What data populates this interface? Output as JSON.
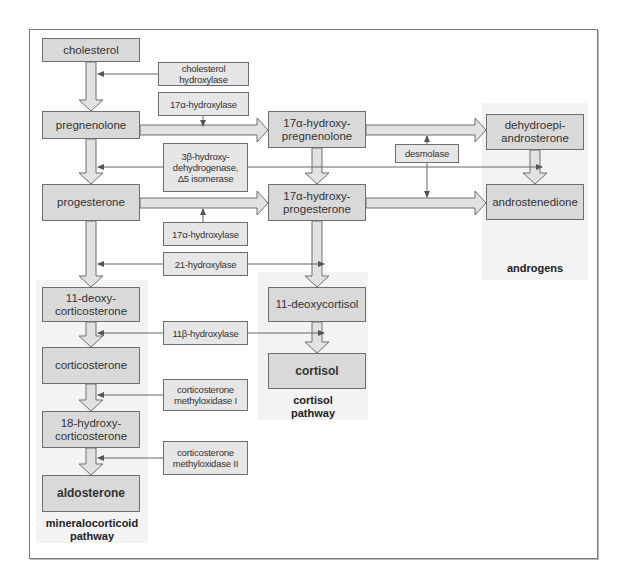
{
  "diagram": {
    "colors": {
      "box_fill": "#d9d9d9",
      "enzyme_fill": "#e6e6e6",
      "zone_fill": "#f3f3f3",
      "stroke": "#6e6e6e",
      "arrow_fill": "#e2e2e2"
    },
    "nodes": {
      "cholesterol": "cholesterol",
      "pregnenolone": "pregnenolone",
      "progesterone": "progesterone",
      "deoxycorticosterone": "11-deoxy-\ncorticosterone",
      "corticosterone": "corticosterone",
      "hydroxycorticosterone": "18-hydroxy-\ncorticosterone",
      "aldosterone": "aldosterone",
      "hydroxypregnenolone": "17α-hydroxy-\npregnenolone",
      "hydroxyprogesterone": "17α-hydroxy-\nprogesterone",
      "deoxycortisol": "11-deoxycortisol",
      "cortisol": "cortisol",
      "dhea": "dehydroepi-\nandrosterone",
      "androstenedione": "androstenedione"
    },
    "enzymes": {
      "cholesterol_hydroxylase": "cholesterol hydroxylase",
      "hydroxylase17_top": "17α-hydroxylase",
      "hsd3b": "3β-hydroxy-\ndehydrogenase,\nΔ5 isomerase",
      "desmolase": "desmolase",
      "hydroxylase17_bottom": "17α-hydroxylase",
      "hydroxylase21": "21-hydroxylase",
      "hydroxylase11b": "11β-hydroxylase",
      "cmo1": "corticosterone\nmethyloxidase I",
      "cmo2": "corticosterone\nmethyloxidase II"
    },
    "pathways": {
      "mineralocorticoid": "mineralocorticoid\npathway",
      "cortisol": "cortisol\npathway",
      "androgens": "androgens"
    }
  }
}
